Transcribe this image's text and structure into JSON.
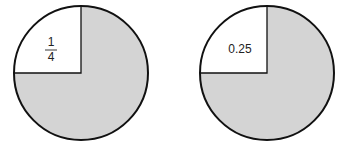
{
  "diagrams": [
    {
      "name": "fraction-circle",
      "label_type": "fraction",
      "numerator": "1",
      "denominator": "4",
      "unshaded_fraction": 0.25
    },
    {
      "name": "decimal-circle",
      "label_type": "decimal",
      "label": "0.25",
      "unshaded_fraction": 0.25
    }
  ],
  "colors": {
    "shaded": "#d4d4d4",
    "unshaded": "#ffffff",
    "outline": "#111111"
  }
}
